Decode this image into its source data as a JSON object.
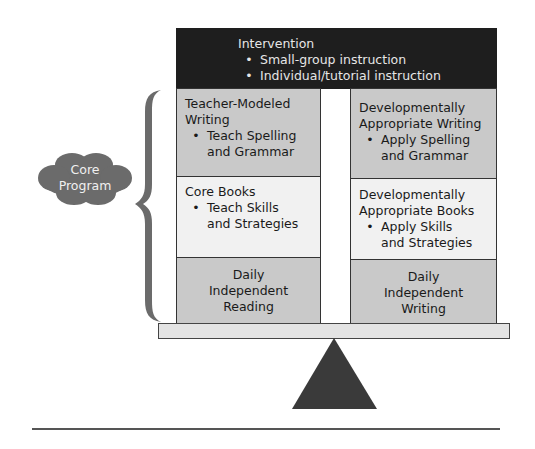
{
  "intervention": {
    "title": "Intervention",
    "items": [
      "Small-group instruction",
      "Individual/tutorial instruction"
    ]
  },
  "left_column": {
    "writing": {
      "title_line1": "Teacher-Modeled",
      "title_line2": "Writing",
      "item_line1": "Teach Spelling",
      "item_line2": "and Grammar"
    },
    "books": {
      "title": "Core Books",
      "item_line1": "Teach Skills",
      "item_line2": "and Strategies"
    },
    "daily": {
      "line1": "Daily",
      "line2": "Independent",
      "line3": "Reading"
    }
  },
  "right_column": {
    "writing": {
      "title_line1": "Developmentally",
      "title_line2": "Appropriate Writing",
      "item_line1": "Apply Spelling",
      "item_line2": "and Grammar"
    },
    "books": {
      "title_line1": "Developmentally",
      "title_line2": "Appropriate Books",
      "item_line1": "Apply Skills",
      "item_line2": "and Strategies"
    },
    "daily": {
      "line1": "Daily",
      "line2": "Independent",
      "line3": "Writing"
    }
  },
  "core_program": {
    "line1": "Core",
    "line2": "Program"
  },
  "bullet": "•",
  "colors": {
    "intervention_bg": "#1e1e1e",
    "dark_cell": "#c9c9c9",
    "light_cell": "#f1f1f1",
    "cloud": "#6b6b6b",
    "fulcrum": "#3a3a3a"
  }
}
